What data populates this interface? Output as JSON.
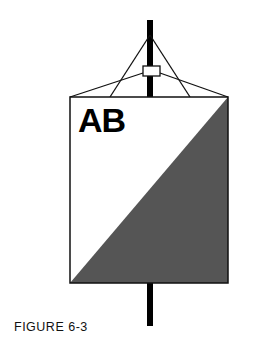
{
  "figure": {
    "marker_label": "AB",
    "caption": "FIGURE 6-3",
    "colors": {
      "pole": "#000000",
      "outline": "#111111",
      "shaded_half": "#555555",
      "background": "#ffffff"
    }
  }
}
